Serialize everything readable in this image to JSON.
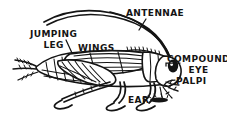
{
  "diagram": {
    "style": "hand-drawn ink line art",
    "ink_color": "#141414",
    "background_color": "#ffffff",
    "width": 227,
    "height": 120
  },
  "labels": {
    "antennae": "ANTENNAE",
    "jumping_leg_line1": "JUMPING",
    "jumping_leg_line2": "LEG",
    "wings": "WINGS",
    "compound_line1": "COMPOUND",
    "compound_line2": "EYE",
    "palpi": "PALPI",
    "ear": "EAR"
  },
  "parts": [
    {
      "name": "antennae",
      "label": "ANTENNAE",
      "side": "top-right"
    },
    {
      "name": "jumping-leg",
      "label": "JUMPING LEG",
      "side": "top-left"
    },
    {
      "name": "wings",
      "label": "WINGS",
      "side": "top-center"
    },
    {
      "name": "compound-eye",
      "label": "COMPOUND EYE",
      "side": "right"
    },
    {
      "name": "palpi",
      "label": "PALPI",
      "side": "right-lower"
    },
    {
      "name": "ear",
      "label": "EAR",
      "side": "bottom-center"
    }
  ]
}
